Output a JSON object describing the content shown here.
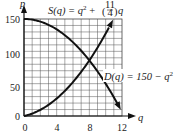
{
  "chart_data": {
    "type": "line",
    "title": "",
    "xlabel": "q",
    "ylabel": "p",
    "xlim": [
      0,
      12
    ],
    "ylim": [
      0,
      150
    ],
    "grid": true,
    "x_ticks": [
      "0",
      "4",
      "8",
      "12"
    ],
    "y_ticks": [
      "0",
      "50",
      "100",
      "150"
    ],
    "series": [
      {
        "name": "S(q) = q^2 + (11/4)q",
        "label": "supply",
        "x": [
          0,
          2,
          4,
          6,
          8,
          10,
          11
        ],
        "values": [
          0,
          9.5,
          27,
          52.5,
          86,
          127.5,
          151.25
        ]
      },
      {
        "name": "D(q) = 150 - q^2",
        "label": "demand",
        "x": [
          0,
          2,
          4,
          6,
          8,
          10,
          12
        ],
        "values": [
          150,
          146,
          134,
          114,
          86,
          50,
          6
        ]
      }
    ],
    "annotations": [
      {
        "text_main": "S(q) = q",
        "sup": "2",
        "rest": " + (",
        "frac_num": "11",
        "frac_den": "4",
        "tail": ")q"
      },
      {
        "text_main": "D(q) = 150 − q",
        "sup": "2"
      }
    ],
    "intersection": {
      "q": 8,
      "p": 86
    }
  },
  "labels": {
    "x_axis": "q",
    "y_axis": "p",
    "tick_x0": "0",
    "tick_x4": "4",
    "tick_x8": "8",
    "tick_x12": "12",
    "tick_y0": "0",
    "tick_y50": "50",
    "tick_y100": "100",
    "tick_y150": "150",
    "supply_eq_lhs": "S(q) = q",
    "supply_eq_sup": "2",
    "supply_eq_mid": " + ",
    "supply_frac_num": "11",
    "supply_frac_den": "4",
    "supply_eq_tail": "q",
    "demand_eq": "D(q) = 150 − q",
    "demand_eq_sup": "2"
  }
}
